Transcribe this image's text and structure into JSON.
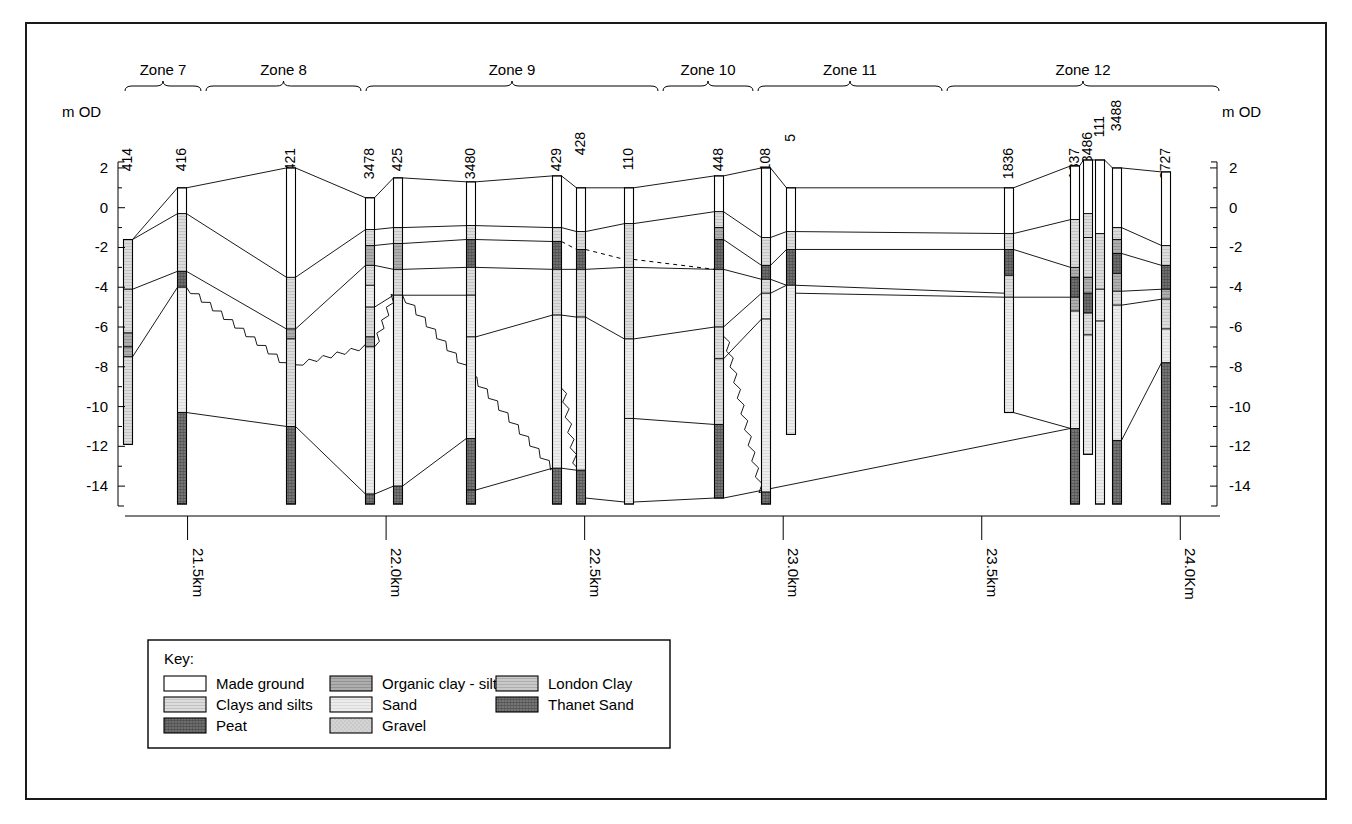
{
  "figure": {
    "axis_label_left": "m OD",
    "axis_label_right": "m OD",
    "y_ticks": [
      "2",
      "0",
      "-2",
      "-4",
      "-6",
      "-8",
      "-10",
      "-12",
      "-14"
    ],
    "y_tick_values": [
      2,
      0,
      -2,
      -4,
      -6,
      -8,
      -10,
      -12,
      -14
    ],
    "y_range": [
      -15,
      2.6
    ],
    "x_ticks": [
      "21.5km",
      "22.0km",
      "22.5km",
      "23.0km",
      "23.5km",
      "24.0Km"
    ],
    "x_tick_values": [
      21.5,
      22.0,
      22.5,
      23.0,
      23.5,
      24.0
    ],
    "x_range_km": [
      21.35,
      24.1
    ]
  },
  "zones": [
    {
      "label": "Zone 7",
      "x0": 125,
      "x1": 201
    },
    {
      "label": "Zone 8",
      "x0": 206,
      "x1": 361
    },
    {
      "label": "Zone 9",
      "x0": 366,
      "x1": 658
    },
    {
      "label": "Zone 10",
      "x0": 663,
      "x1": 753
    },
    {
      "label": "Zone 11",
      "x0": 758,
      "x1": 942
    },
    {
      "label": "Zone 12",
      "x0": 947,
      "x1": 1219
    }
  ],
  "boreholes": [
    {
      "id": "414",
      "x": 128,
      "top": -1.6,
      "bottom": -11.9,
      "layers": [
        [
          -1.6,
          -4.1,
          "clays"
        ],
        [
          -4.1,
          -6.3,
          "clays"
        ],
        [
          -6.3,
          -7.0,
          "organic"
        ],
        [
          -7.0,
          -7.5,
          "organic"
        ],
        [
          -7.5,
          -11.9,
          "clays"
        ]
      ]
    },
    {
      "id": "416",
      "x": 182,
      "top": 1.0,
      "bottom": -14.9,
      "layers": [
        [
          1.0,
          -0.3,
          "made"
        ],
        [
          -0.3,
          -3.2,
          "clays"
        ],
        [
          -3.2,
          -4.0,
          "peat"
        ],
        [
          -4.0,
          -10.3,
          "sand"
        ],
        [
          -10.3,
          -14.9,
          "thanet"
        ]
      ]
    },
    {
      "id": "421",
      "x": 291,
      "top": 2.0,
      "bottom": -14.9,
      "layers": [
        [
          2.0,
          -3.5,
          "made"
        ],
        [
          -3.5,
          -6.1,
          "clays"
        ],
        [
          -6.1,
          -6.6,
          "organic"
        ],
        [
          -6.6,
          -11.0,
          "clays"
        ],
        [
          -11.0,
          -14.9,
          "thanet"
        ]
      ]
    },
    {
      "id": "3478",
      "x": 370,
      "top": 0.5,
      "bottom": -14.9,
      "layers": [
        [
          0.5,
          -1.1,
          "made"
        ],
        [
          -1.1,
          -1.9,
          "clays"
        ],
        [
          -1.9,
          -2.9,
          "organic"
        ],
        [
          -2.9,
          -3.9,
          "clays"
        ],
        [
          -3.9,
          -5.0,
          "sand"
        ],
        [
          -5.0,
          -6.5,
          "clays"
        ],
        [
          -6.5,
          -7.0,
          "organic"
        ],
        [
          -7.0,
          -14.4,
          "sand"
        ],
        [
          -14.4,
          -14.9,
          "thanet"
        ]
      ]
    },
    {
      "id": "425",
      "x": 398,
      "top": 1.5,
      "bottom": -14.9,
      "layers": [
        [
          1.5,
          -1.0,
          "made"
        ],
        [
          -1.0,
          -1.8,
          "clays"
        ],
        [
          -1.8,
          -3.1,
          "organic"
        ],
        [
          -3.1,
          -4.4,
          "clays"
        ],
        [
          -4.4,
          -14.0,
          "sand"
        ],
        [
          -14.0,
          -14.9,
          "thanet"
        ]
      ]
    },
    {
      "id": "3480",
      "x": 471,
      "top": 1.3,
      "bottom": -14.9,
      "layers": [
        [
          1.3,
          -0.9,
          "made"
        ],
        [
          -0.9,
          -1.6,
          "clays"
        ],
        [
          -1.6,
          -3.0,
          "peat"
        ],
        [
          -3.0,
          -4.4,
          "clays"
        ],
        [
          -4.4,
          -6.5,
          "sand"
        ],
        [
          -6.5,
          -11.6,
          "sand"
        ],
        [
          -11.6,
          -14.2,
          "thanet"
        ],
        [
          -14.2,
          -14.9,
          "thanet"
        ]
      ]
    },
    {
      "id": "429",
      "x": 557,
      "top": 1.6,
      "bottom": -14.9,
      "layers": [
        [
          1.6,
          -1.0,
          "made"
        ],
        [
          -1.0,
          -1.7,
          "clays"
        ],
        [
          -1.7,
          -3.1,
          "peat"
        ],
        [
          -3.1,
          -5.4,
          "clays"
        ],
        [
          -5.4,
          -13.1,
          "sand"
        ],
        [
          -13.1,
          -14.9,
          "thanet"
        ]
      ]
    },
    {
      "id": "428",
      "x": 581,
      "top": 1.0,
      "bottom": -14.9,
      "layers": [
        [
          1.0,
          -1.2,
          "made"
        ],
        [
          -1.2,
          -2.1,
          "clays"
        ],
        [
          -2.1,
          -3.1,
          "peat"
        ],
        [
          -3.1,
          -5.5,
          "clays"
        ],
        [
          -5.5,
          -13.2,
          "sand"
        ],
        [
          -13.2,
          -14.9,
          "thanet"
        ]
      ]
    },
    {
      "id": "110",
      "x": 629,
      "top": 1.0,
      "bottom": -14.9,
      "layers": [
        [
          1.0,
          -0.8,
          "made"
        ],
        [
          -0.8,
          -3.0,
          "clays"
        ],
        [
          -3.0,
          -6.6,
          "clays"
        ],
        [
          -6.6,
          -10.6,
          "sand"
        ],
        [
          -10.6,
          -14.9,
          "sand"
        ]
      ]
    },
    {
      "id": "448",
      "x": 719,
      "top": 1.6,
      "bottom": -14.6,
      "layers": [
        [
          1.6,
          -0.2,
          "made"
        ],
        [
          -0.2,
          -1.0,
          "clays"
        ],
        [
          -1.0,
          -1.6,
          "organic"
        ],
        [
          -1.6,
          -3.1,
          "peat"
        ],
        [
          -3.1,
          -6.0,
          "clays"
        ],
        [
          -6.0,
          -7.6,
          "clays"
        ],
        [
          -7.6,
          -10.9,
          "clays"
        ],
        [
          -10.9,
          -14.6,
          "thanet"
        ]
      ]
    },
    {
      "id": "108",
      "x": 766,
      "top": 2.0,
      "bottom": -14.9,
      "layers": [
        [
          2.0,
          -1.5,
          "made"
        ],
        [
          -1.5,
          -2.9,
          "clays"
        ],
        [
          -2.9,
          -3.6,
          "peat"
        ],
        [
          -3.6,
          -4.3,
          "clays"
        ],
        [
          -4.3,
          -5.6,
          "sand"
        ],
        [
          -5.6,
          -14.3,
          "sand"
        ],
        [
          -14.3,
          -14.9,
          "thanet"
        ]
      ]
    },
    {
      "id": "5",
      "x": 791,
      "top": 1.0,
      "bottom": -11.4,
      "layers": [
        [
          1.0,
          -1.2,
          "made"
        ],
        [
          -1.2,
          -2.1,
          "clays"
        ],
        [
          -2.1,
          -3.9,
          "peat"
        ],
        [
          -3.9,
          -11.4,
          "sand"
        ]
      ]
    },
    {
      "id": "1836",
      "x": 1009,
      "top": 1.0,
      "bottom": -10.3,
      "layers": [
        [
          1.0,
          -1.3,
          "made"
        ],
        [
          -1.3,
          -2.1,
          "clays"
        ],
        [
          -2.1,
          -3.4,
          "peat"
        ],
        [
          -3.4,
          -4.5,
          "clays"
        ],
        [
          -4.5,
          -10.3,
          "sand"
        ]
      ]
    },
    {
      "id": "1837",
      "x": 1075,
      "top": 2.1,
      "bottom": -14.9,
      "layers": [
        [
          2.1,
          -0.6,
          "made"
        ],
        [
          -0.6,
          -3.0,
          "clays"
        ],
        [
          -3.0,
          -3.5,
          "organic"
        ],
        [
          -3.5,
          -4.5,
          "peat"
        ],
        [
          -4.5,
          -5.2,
          "organic"
        ],
        [
          -5.2,
          -11.1,
          "sand"
        ],
        [
          -11.1,
          -14.9,
          "thanet"
        ]
      ]
    },
    {
      "id": "3486",
      "x": 1088,
      "top": 2.4,
      "bottom": -12.4,
      "layers": [
        [
          2.4,
          -0.3,
          "made"
        ],
        [
          -0.3,
          -1.5,
          "clays"
        ],
        [
          -1.5,
          -3.5,
          "clays"
        ],
        [
          -3.5,
          -4.3,
          "organic"
        ],
        [
          -4.3,
          -5.3,
          "peat"
        ],
        [
          -5.3,
          -6.4,
          "clays"
        ],
        [
          -6.4,
          -12.4,
          "sand"
        ]
      ]
    },
    {
      "id": "111",
      "x": 1100,
      "top": 2.4,
      "bottom": -14.9,
      "layers": [
        [
          2.4,
          -1.3,
          "made"
        ],
        [
          -1.3,
          -4.1,
          "clays"
        ],
        [
          -4.1,
          -5.7,
          "sand"
        ],
        [
          -5.7,
          -14.9,
          "sand"
        ]
      ]
    },
    {
      "id": "3488",
      "x": 1117,
      "top": 2.0,
      "bottom": -14.9,
      "layers": [
        [
          2.0,
          -1.0,
          "made"
        ],
        [
          -1.0,
          -1.6,
          "clays"
        ],
        [
          -1.6,
          -2.3,
          "organic"
        ],
        [
          -2.3,
          -3.3,
          "peat"
        ],
        [
          -3.3,
          -4.2,
          "organic"
        ],
        [
          -4.2,
          -4.9,
          "clays"
        ],
        [
          -4.9,
          -11.7,
          "sand"
        ],
        [
          -11.7,
          -14.9,
          "thanet"
        ]
      ]
    },
    {
      "id": "2727",
      "x": 1166,
      "top": 1.8,
      "bottom": -14.9,
      "layers": [
        [
          1.8,
          -1.9,
          "made"
        ],
        [
          -1.9,
          -2.9,
          "clays"
        ],
        [
          -2.9,
          -4.1,
          "peat"
        ],
        [
          -4.1,
          -4.6,
          "organic"
        ],
        [
          -4.6,
          -6.1,
          "clays"
        ],
        [
          -6.1,
          -7.8,
          "sand"
        ],
        [
          -7.8,
          -14.9,
          "thanet"
        ]
      ]
    }
  ],
  "key": {
    "title": "Key:",
    "items": [
      {
        "label": "Made ground",
        "fill": "made"
      },
      {
        "label": "Clays and silts",
        "fill": "clays"
      },
      {
        "label": "Peat",
        "fill": "peat"
      },
      {
        "label": "Organic clay - silt",
        "fill": "organic"
      },
      {
        "label": "Sand",
        "fill": "sand"
      },
      {
        "label": "Gravel",
        "fill": "gravel"
      },
      {
        "label": "London Clay",
        "fill": "london"
      },
      {
        "label": "Thanet Sand",
        "fill": "thanet"
      }
    ]
  },
  "colors": {
    "made": "#ffffff",
    "clays": "#d8d8d8",
    "peat": "#6e6e6e",
    "organic": "#a8a8a8",
    "sand": "#e6e6e6",
    "gravel": "#cfcfcf",
    "london": "#c4c4c4",
    "thanet": "#777777",
    "line": "#000000",
    "frame": "#1a1a1a"
  }
}
